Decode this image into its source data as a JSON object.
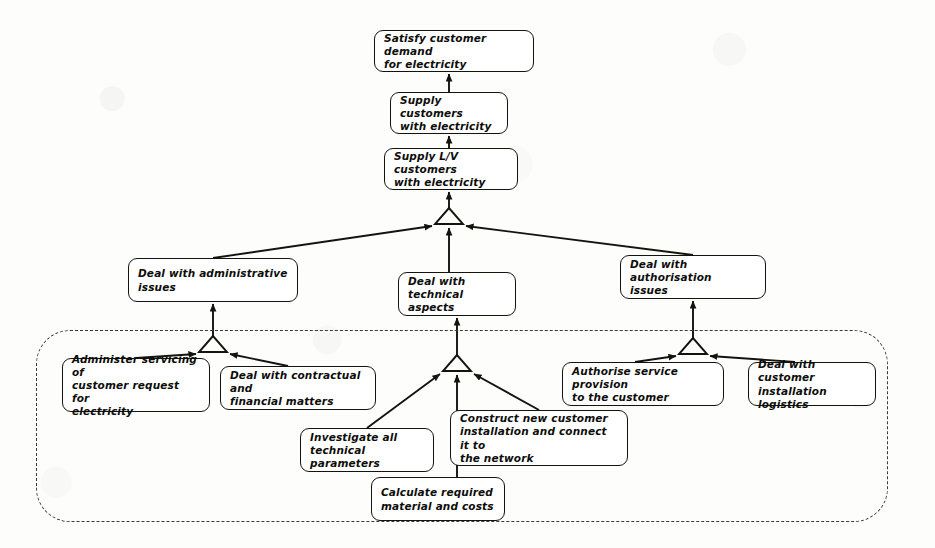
{
  "diagram": {
    "type": "goal-refinement-tree",
    "ink_color": "#14140f",
    "paper_color": "#fdfdfc",
    "boundary_label": ""
  },
  "nodes": [
    {
      "id": "satisfy-customer-demand",
      "lines": [
        "Satisfy customer demand",
        "for electricity"
      ],
      "level": 0,
      "x": 374,
      "y": 30,
      "w": 160,
      "h": 42
    },
    {
      "id": "supply-customers",
      "lines": [
        "Supply customers",
        "with electricity"
      ],
      "level": 1,
      "x": 390,
      "y": 92,
      "w": 118,
      "h": 42
    },
    {
      "id": "supply-lv-customers",
      "lines": [
        "Supply L/V customers",
        "with electricity"
      ],
      "level": 2,
      "x": 384,
      "y": 148,
      "w": 134,
      "h": 42
    },
    {
      "id": "deal-administrative-issues",
      "lines": [
        "Deal with administrative",
        "issues"
      ],
      "level": 3,
      "x": 128,
      "y": 258,
      "w": 170,
      "h": 44
    },
    {
      "id": "deal-technical-aspects",
      "lines": [
        "Deal with technical",
        "aspects"
      ],
      "level": 3,
      "x": 398,
      "y": 272,
      "w": 118,
      "h": 44
    },
    {
      "id": "deal-authorisation-issues",
      "lines": [
        "Deal with authorisation",
        "issues"
      ],
      "level": 3,
      "x": 620,
      "y": 255,
      "w": 146,
      "h": 44
    },
    {
      "id": "administer-servicing",
      "lines": [
        "Administer servicing of",
        "customer request  for",
        "electricity"
      ],
      "level": 4,
      "x": 62,
      "y": 358,
      "w": 148,
      "h": 54
    },
    {
      "id": "deal-contractual-financial",
      "lines": [
        "Deal with contractual and",
        "financial matters"
      ],
      "level": 4,
      "x": 220,
      "y": 366,
      "w": 156,
      "h": 44
    },
    {
      "id": "authorise-service-provision",
      "lines": [
        "Authorise service provision",
        "to the customer"
      ],
      "level": 4,
      "x": 562,
      "y": 362,
      "w": 162,
      "h": 44
    },
    {
      "id": "deal-customer-installation-logistics",
      "lines": [
        "Deal with customer",
        "installation logistics"
      ],
      "level": 4,
      "x": 748,
      "y": 362,
      "w": 128,
      "h": 44
    },
    {
      "id": "investigate-technical-parameters",
      "lines": [
        "Investigate all",
        "technical parameters"
      ],
      "level": 5,
      "x": 300,
      "y": 428,
      "w": 134,
      "h": 44
    },
    {
      "id": "construct-new-installation",
      "lines": [
        "Construct new customer",
        "installation and connect it to",
        "the network"
      ],
      "level": 5,
      "x": 450,
      "y": 410,
      "w": 178,
      "h": 56
    },
    {
      "id": "calculate-required-material",
      "lines": [
        "Calculate required",
        "material and costs"
      ],
      "level": 6,
      "x": 371,
      "y": 477,
      "w": 134,
      "h": 44
    }
  ],
  "edges": [
    {
      "from": "supply-customers",
      "to": "satisfy-customer-demand"
    },
    {
      "from": "supply-lv-customers",
      "to": "supply-customers"
    },
    {
      "from": "refinement-junction-lv",
      "to": "supply-lv-customers"
    },
    {
      "from": "deal-administrative-issues",
      "to": "refinement-junction-lv"
    },
    {
      "from": "deal-technical-aspects",
      "to": "refinement-junction-lv"
    },
    {
      "from": "deal-authorisation-issues",
      "to": "refinement-junction-lv"
    },
    {
      "from": "refinement-junction-admin",
      "to": "deal-administrative-issues"
    },
    {
      "from": "administer-servicing",
      "to": "refinement-junction-admin"
    },
    {
      "from": "deal-contractual-financial",
      "to": "refinement-junction-admin"
    },
    {
      "from": "refinement-junction-tech",
      "to": "deal-technical-aspects"
    },
    {
      "from": "investigate-technical-parameters",
      "to": "refinement-junction-tech"
    },
    {
      "from": "calculate-required-material",
      "to": "refinement-junction-tech"
    },
    {
      "from": "construct-new-installation",
      "to": "refinement-junction-tech"
    },
    {
      "from": "refinement-junction-auth",
      "to": "deal-authorisation-issues"
    },
    {
      "from": "authorise-service-provision",
      "to": "refinement-junction-auth"
    },
    {
      "from": "deal-customer-installation-logistics",
      "to": "refinement-junction-auth"
    }
  ],
  "boundary": {
    "name": "system-scope-boundary",
    "x": 36,
    "y": 330,
    "w": 852,
    "h": 192
  }
}
